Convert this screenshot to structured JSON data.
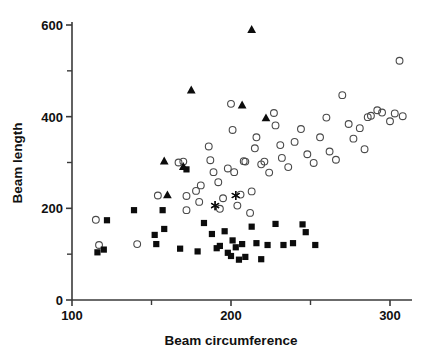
{
  "chart_data": {
    "type": "scatter",
    "title": "",
    "xlabel": "Beam circumference",
    "ylabel": "Beam length",
    "xlim": [
      100,
      310
    ],
    "ylim": [
      0,
      610
    ],
    "grid": false,
    "legend": "none",
    "x_ticks_major": [
      100,
      200,
      300
    ],
    "x_ticks_minor": [
      150,
      250
    ],
    "x_tick_labels": [
      "100",
      "200",
      "300"
    ],
    "y_ticks_major": [
      0,
      200,
      400,
      600
    ],
    "y_ticks_minor": [
      100,
      300,
      500
    ],
    "y_tick_labels": [
      "0",
      "200",
      "400",
      "600"
    ],
    "series": [
      {
        "name": "open-circle",
        "marker": "circle-open",
        "color": "#4a4a4a",
        "points": [
          [
            115,
            175
          ],
          [
            117,
            120
          ],
          [
            141,
            122
          ],
          [
            154,
            228
          ],
          [
            167,
            300
          ],
          [
            170,
            302
          ],
          [
            172,
            227
          ],
          [
            172,
            196
          ],
          [
            178,
            238
          ],
          [
            180,
            214
          ],
          [
            181,
            250
          ],
          [
            186,
            335
          ],
          [
            187,
            305
          ],
          [
            189,
            279
          ],
          [
            192,
            257
          ],
          [
            193,
            199
          ],
          [
            195,
            222
          ],
          [
            198,
            287
          ],
          [
            200,
            428
          ],
          [
            201,
            371
          ],
          [
            202,
            279
          ],
          [
            204,
            206
          ],
          [
            206,
            230
          ],
          [
            208,
            303
          ],
          [
            209,
            302
          ],
          [
            212,
            190
          ],
          [
            213,
            237
          ],
          [
            215,
            331
          ],
          [
            216,
            355
          ],
          [
            219,
            296
          ],
          [
            221,
            302
          ],
          [
            224,
            278
          ],
          [
            227,
            408
          ],
          [
            228,
            381
          ],
          [
            231,
            338
          ],
          [
            232,
            310
          ],
          [
            236,
            290
          ],
          [
            240,
            345
          ],
          [
            244,
            373
          ],
          [
            248,
            318
          ],
          [
            252,
            299
          ],
          [
            256,
            355
          ],
          [
            260,
            398
          ],
          [
            262,
            324
          ],
          [
            266,
            306
          ],
          [
            270,
            447
          ],
          [
            274,
            384
          ],
          [
            277,
            352
          ],
          [
            281,
            375
          ],
          [
            284,
            329
          ],
          [
            286,
            399
          ],
          [
            288,
            402
          ],
          [
            292,
            414
          ],
          [
            295,
            409
          ],
          [
            300,
            390
          ],
          [
            303,
            407
          ],
          [
            306,
            522
          ],
          [
            308,
            401
          ]
        ]
      },
      {
        "name": "filled-square",
        "marker": "square-filled",
        "color": "#0c0c0c",
        "points": [
          [
            116,
            104
          ],
          [
            120,
            110
          ],
          [
            122,
            174
          ],
          [
            139,
            196
          ],
          [
            152,
            142
          ],
          [
            153,
            122
          ],
          [
            157,
            196
          ],
          [
            158,
            155
          ],
          [
            168,
            112
          ],
          [
            172,
            285
          ],
          [
            179,
            106
          ],
          [
            183,
            168
          ],
          [
            188,
            144
          ],
          [
            191,
            113
          ],
          [
            193,
            118
          ],
          [
            196,
            150
          ],
          [
            198,
            103
          ],
          [
            200,
            96
          ],
          [
            201,
            130
          ],
          [
            203,
            115
          ],
          [
            205,
            88
          ],
          [
            207,
            122
          ],
          [
            209,
            94
          ],
          [
            213,
            160
          ],
          [
            216,
            124
          ],
          [
            219,
            89
          ],
          [
            223,
            120
          ],
          [
            228,
            166
          ],
          [
            233,
            120
          ],
          [
            239,
            124
          ],
          [
            245,
            165
          ],
          [
            247,
            148
          ],
          [
            253,
            120
          ]
        ]
      },
      {
        "name": "filled-triangle",
        "marker": "triangle-filled",
        "color": "#0c0c0c",
        "points": [
          [
            158,
            303
          ],
          [
            160,
            229
          ],
          [
            170,
            291
          ],
          [
            175,
            458
          ],
          [
            207,
            425
          ],
          [
            213,
            590
          ],
          [
            222,
            397
          ]
        ]
      },
      {
        "name": "asterisk",
        "marker": "star",
        "color": "#0c0c0c",
        "points": [
          [
            190,
            206
          ],
          [
            203,
            228
          ]
        ]
      }
    ]
  },
  "axes": {
    "x_title": "Beam circumference",
    "y_title": "Beam length"
  }
}
